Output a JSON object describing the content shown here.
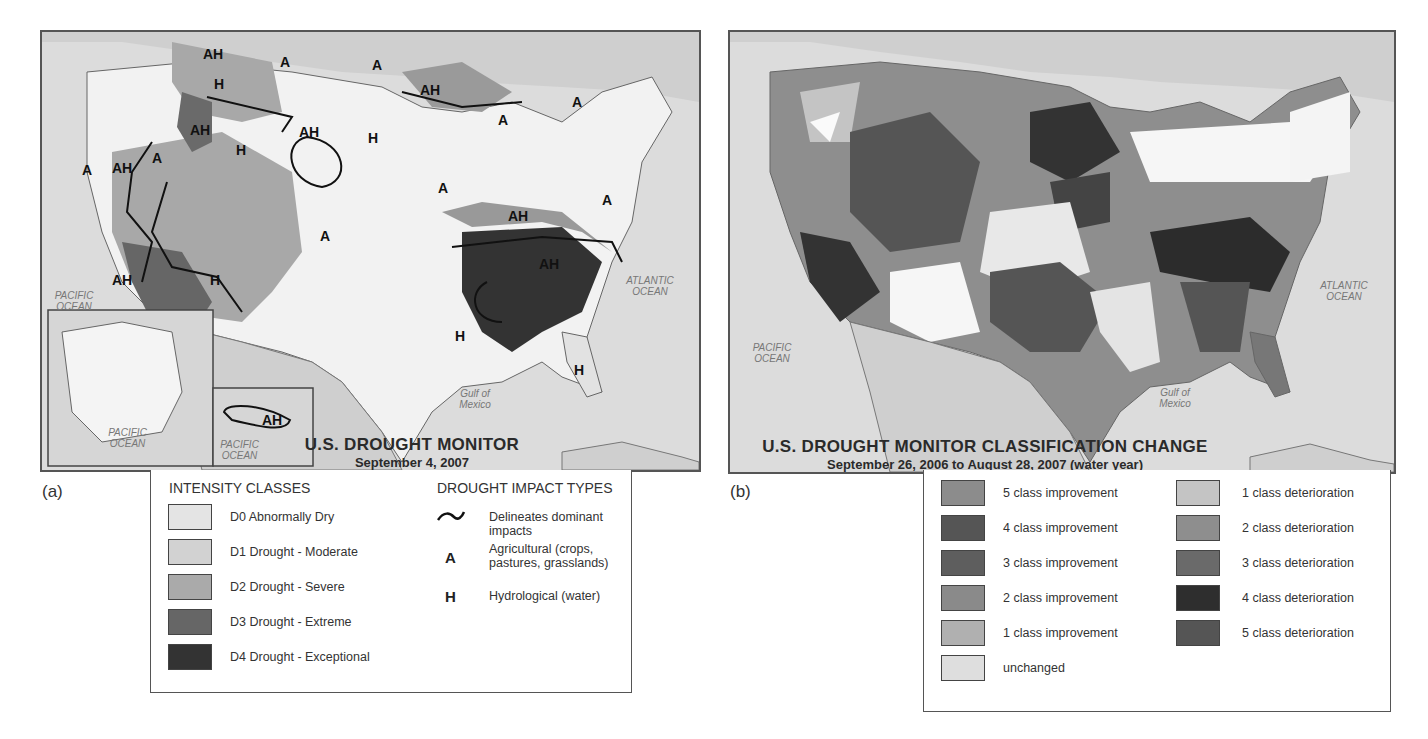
{
  "panel_a": {
    "label": "(a)",
    "title": "U.S. DROUGHT MONITOR",
    "subtitle": "September 4, 2007",
    "ocean_labels": {
      "pacific": "PACIFIC OCEAN",
      "atlantic": "ATLANTIC OCEAN",
      "gulf": "Gulf of Mexico",
      "alaska_pacific": "PACIFIC OCEAN",
      "hawaii_pacific": "PACIFIC OCEAN"
    },
    "map_markers": [
      "AH",
      "A",
      "H",
      "AH",
      "A",
      "AH",
      "H",
      "A",
      "AH",
      "H",
      "A",
      "AH",
      "A",
      "AH",
      "A",
      "A",
      "AH",
      "A",
      "H",
      "AH",
      "H",
      "A",
      "AH"
    ],
    "legend": {
      "intensity_header": "INTENSITY CLASSES",
      "intensity_classes": [
        {
          "label": "D0 Abnormally Dry",
          "color": "#e4e4e4"
        },
        {
          "label": "D1 Drought - Moderate",
          "color": "#d2d2d2"
        },
        {
          "label": "D2 Drought - Severe",
          "color": "#aaaaaa"
        },
        {
          "label": "D3 Drought - Extreme",
          "color": "#666666"
        },
        {
          "label": "D4 Drought - Exceptional",
          "color": "#333333"
        }
      ],
      "impact_header": "DROUGHT IMPACT TYPES",
      "impact_types": [
        {
          "symbol": "~",
          "label": "Delineates dominant impacts"
        },
        {
          "symbol": "A",
          "label": "Agricultural (crops, pastures, grasslands)"
        },
        {
          "symbol": "H",
          "label": "Hydrological (water)"
        }
      ]
    }
  },
  "panel_b": {
    "label": "(b)",
    "title": "U.S. DROUGHT MONITOR CLASSIFICATION CHANGE",
    "subtitle": "September 26, 2006 to August 28, 2007 (water year)",
    "ocean_labels": {
      "pacific": "PACIFIC OCEAN",
      "atlantic": "ATLANTIC OCEAN",
      "gulf": "Gulf of Mexico"
    },
    "legend": {
      "left": [
        {
          "label": "5 class improvement",
          "color": "#8c8c8c"
        },
        {
          "label": "4 class improvement",
          "color": "#555555"
        },
        {
          "label": "3 class improvement",
          "color": "#5e5e5e"
        },
        {
          "label": "2 class improvement",
          "color": "#8a8a8a"
        },
        {
          "label": "1 class improvement",
          "color": "#b0b0b0"
        },
        {
          "label": "unchanged",
          "color": "#dedede"
        }
      ],
      "right": [
        {
          "label": "1 class deterioration",
          "color": "#c4c4c4"
        },
        {
          "label": "2 class deterioration",
          "color": "#8e8e8e"
        },
        {
          "label": "3 class deterioration",
          "color": "#6a6a6a"
        },
        {
          "label": "4 class deterioration",
          "color": "#2e2e2e"
        },
        {
          "label": "5 class deterioration",
          "color": "#555555"
        }
      ]
    }
  }
}
